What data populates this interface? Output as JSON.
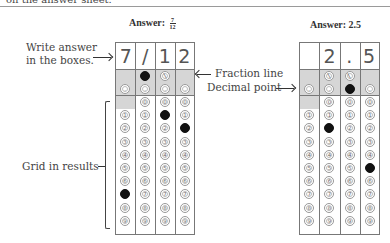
{
  "header": {
    "partial_text": "on the answer sheet."
  },
  "left_example": {
    "title_prefix": "Answer:",
    "fraction_num": "7",
    "fraction_den": "12",
    "write_cells": [
      "7",
      "/",
      "1",
      "2"
    ],
    "filled": {
      "fraction": [
        1
      ],
      "decimal": [],
      "digits": {
        "0": 7,
        "2": 1,
        "3": 2
      }
    }
  },
  "right_example": {
    "title": "Answer: 2.5",
    "write_cells": [
      "",
      "2",
      ".",
      "5"
    ],
    "filled": {
      "fraction": [],
      "decimal": [
        2
      ],
      "digits": {
        "1": 2,
        "3": 5
      }
    }
  },
  "labels": {
    "write_answer_line1": "Write answer",
    "write_answer_line2": "in the boxes.",
    "fraction_line": "Fraction line",
    "decimal_point": "Decimal point",
    "grid_in_results": "Grid in results"
  },
  "bubble_symbols": {
    "fraction": "/",
    "decimal": ".",
    "digits": [
      "0",
      "1",
      "2",
      "3",
      "4",
      "5",
      "6",
      "7",
      "8",
      "9"
    ]
  }
}
